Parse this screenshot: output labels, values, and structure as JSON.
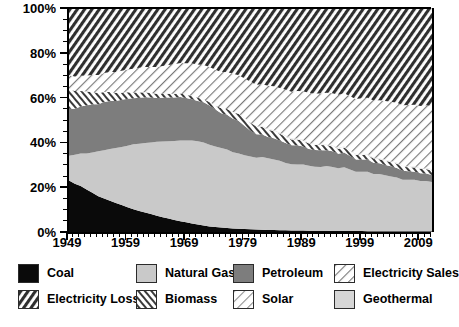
{
  "chart_data": {
    "type": "area",
    "title": "",
    "subtitle": "",
    "xlabel": "",
    "ylabel": "",
    "stacked": true,
    "normalized_percent": true,
    "grid": false,
    "legend_position": "bottom",
    "xlim": [
      1949,
      2011
    ],
    "ylim": [
      0,
      100
    ],
    "yticks": [
      0,
      20,
      40,
      60,
      80,
      100
    ],
    "ytick_labels": [
      "0%",
      "20%",
      "40%",
      "60%",
      "80%",
      "100%"
    ],
    "xticks": [
      1949,
      1959,
      1969,
      1979,
      1989,
      1999,
      2009
    ],
    "xtick_labels": [
      "1949",
      "1959",
      "1969",
      "1979",
      "1989",
      "1999",
      "2009"
    ],
    "x_minor_tick_interval": 1,
    "y_minor_tick_interval": 5,
    "x": [
      1949,
      1950,
      1951,
      1952,
      1953,
      1954,
      1955,
      1956,
      1957,
      1958,
      1959,
      1960,
      1961,
      1962,
      1963,
      1964,
      1965,
      1966,
      1967,
      1968,
      1969,
      1970,
      1971,
      1972,
      1973,
      1974,
      1975,
      1976,
      1977,
      1978,
      1979,
      1980,
      1981,
      1982,
      1983,
      1984,
      1985,
      1986,
      1987,
      1988,
      1989,
      1990,
      1991,
      1992,
      1993,
      1994,
      1995,
      1996,
      1997,
      1998,
      1999,
      2000,
      2001,
      2002,
      2003,
      2004,
      2005,
      2006,
      2007,
      2008,
      2009,
      2010,
      2011
    ],
    "series": [
      {
        "name": "Coal",
        "color": "#0a0a0a",
        "pattern": "solid",
        "values": [
          23.0,
          21.5,
          20.5,
          19.0,
          17.5,
          16.0,
          15.0,
          14.0,
          13.0,
          12.0,
          11.0,
          10.2,
          9.4,
          8.7,
          8.0,
          7.3,
          6.6,
          6.0,
          5.4,
          4.8,
          4.3,
          3.8,
          3.3,
          2.9,
          2.5,
          2.2,
          2.0,
          1.8,
          1.6,
          1.5,
          1.3,
          1.2,
          1.1,
          1.0,
          0.9,
          0.85,
          0.8,
          0.75,
          0.7,
          0.68,
          0.65,
          0.6,
          0.58,
          0.55,
          0.52,
          0.5,
          0.48,
          0.46,
          0.44,
          0.42,
          0.4,
          0.38,
          0.36,
          0.35,
          0.34,
          0.33,
          0.32,
          0.31,
          0.3,
          0.3,
          0.29,
          0.28,
          0.28
        ]
      },
      {
        "name": "Natural Gas",
        "color": "#c9c9c9",
        "pattern": "solid",
        "values": [
          11.0,
          13.0,
          14.5,
          16.0,
          18.0,
          20.0,
          21.5,
          23.0,
          24.5,
          26.0,
          27.5,
          29.0,
          30.0,
          31.0,
          32.0,
          33.0,
          33.8,
          34.5,
          35.2,
          36.0,
          36.5,
          37.0,
          37.2,
          37.0,
          36.5,
          36.0,
          35.5,
          35.0,
          34.0,
          33.5,
          33.0,
          32.5,
          32.0,
          32.5,
          32.0,
          31.5,
          31.0,
          30.0,
          29.5,
          29.5,
          29.5,
          29.0,
          28.5,
          28.5,
          29.0,
          28.5,
          28.0,
          28.5,
          27.5,
          26.5,
          26.5,
          26.5,
          25.5,
          25.5,
          25.0,
          24.5,
          24.0,
          23.0,
          23.0,
          23.0,
          22.5,
          22.5,
          22.0
        ]
      },
      {
        "name": "Petroleum",
        "color": "#7d7d7d",
        "pattern": "solid",
        "values": [
          21.0,
          20.5,
          21.0,
          21.5,
          21.5,
          21.0,
          21.5,
          21.5,
          21.0,
          21.0,
          21.0,
          20.5,
          20.5,
          20.5,
          20.0,
          19.5,
          19.5,
          19.5,
          19.5,
          19.5,
          19.0,
          18.5,
          18.0,
          18.0,
          17.5,
          16.5,
          15.5,
          15.5,
          15.0,
          14.5,
          13.0,
          11.5,
          10.5,
          10.0,
          9.5,
          9.5,
          9.0,
          9.0,
          8.5,
          8.5,
          8.0,
          7.5,
          7.5,
          7.5,
          7.0,
          7.0,
          6.5,
          6.5,
          6.0,
          5.5,
          5.5,
          5.5,
          5.0,
          4.8,
          4.6,
          4.5,
          4.3,
          4.0,
          3.8,
          3.6,
          3.4,
          3.3,
          3.2
        ]
      },
      {
        "name": "Biomass",
        "color": "#ffffff",
        "pattern": "dense-diagonal",
        "values": [
          9.0,
          8.0,
          7.0,
          6.2,
          5.5,
          5.0,
          4.5,
          4.0,
          3.6,
          3.2,
          2.9,
          2.6,
          2.4,
          2.2,
          2.0,
          1.9,
          1.8,
          1.7,
          1.6,
          1.5,
          1.5,
          1.4,
          1.4,
          1.4,
          1.5,
          1.8,
          2.2,
          2.6,
          3.0,
          3.2,
          3.5,
          3.6,
          3.5,
          3.4,
          3.3,
          3.2,
          3.1,
          2.8,
          2.6,
          2.6,
          2.6,
          2.4,
          2.3,
          2.3,
          2.2,
          2.2,
          2.2,
          2.3,
          2.1,
          2.0,
          2.0,
          2.0,
          1.9,
          1.8,
          1.9,
          1.9,
          1.9,
          1.8,
          1.8,
          1.9,
          1.9,
          2.0,
          2.0
        ]
      },
      {
        "name": "Solar",
        "color": "#ffffff",
        "pattern": "light-diagonal",
        "values": [
          0,
          0,
          0,
          0,
          0,
          0,
          0,
          0,
          0,
          0,
          0,
          0,
          0,
          0,
          0,
          0,
          0,
          0,
          0,
          0,
          0,
          0,
          0,
          0,
          0,
          0,
          0,
          0,
          0,
          0.05,
          0.1,
          0.15,
          0.2,
          0.25,
          0.3,
          0.3,
          0.3,
          0.3,
          0.3,
          0.3,
          0.3,
          0.3,
          0.3,
          0.3,
          0.3,
          0.3,
          0.3,
          0.3,
          0.3,
          0.3,
          0.3,
          0.3,
          0.3,
          0.3,
          0.3,
          0.3,
          0.3,
          0.3,
          0.3,
          0.3,
          0.3,
          0.35,
          0.4
        ]
      },
      {
        "name": "Geothermal",
        "color": "#d6d6d6",
        "pattern": "solid",
        "values": [
          0,
          0,
          0,
          0,
          0,
          0,
          0,
          0,
          0,
          0,
          0,
          0,
          0,
          0,
          0,
          0,
          0,
          0,
          0,
          0,
          0,
          0,
          0,
          0,
          0,
          0,
          0,
          0,
          0,
          0.05,
          0.1,
          0.1,
          0.12,
          0.14,
          0.16,
          0.18,
          0.2,
          0.2,
          0.2,
          0.2,
          0.2,
          0.2,
          0.2,
          0.2,
          0.2,
          0.2,
          0.2,
          0.2,
          0.2,
          0.2,
          0.2,
          0.2,
          0.2,
          0.2,
          0.2,
          0.2,
          0.2,
          0.2,
          0.2,
          0.2,
          0.2,
          0.2,
          0.2
        ]
      },
      {
        "name": "Electricity Sales",
        "color": "#ffffff",
        "pattern": "light-diagonal",
        "values": [
          6.0,
          6.4,
          6.8,
          7.2,
          7.6,
          8.1,
          8.5,
          8.9,
          9.3,
          9.8,
          10.2,
          10.6,
          11.0,
          11.3,
          11.7,
          12.0,
          12.4,
          12.8,
          13.2,
          13.6,
          14.0,
          14.5,
          14.9,
          15.3,
          15.7,
          15.9,
          16.2,
          16.5,
          17.0,
          17.2,
          17.5,
          18.0,
          18.3,
          18.7,
          19.1,
          19.5,
          19.9,
          20.4,
          20.8,
          21.2,
          21.6,
          22.0,
          22.4,
          22.5,
          22.9,
          23.2,
          23.6,
          23.7,
          24.1,
          24.5,
          24.8,
          25.1,
          25.5,
          25.9,
          26.1,
          26.4,
          26.7,
          27.0,
          27.3,
          27.5,
          27.7,
          28.0,
          28.2
        ]
      },
      {
        "name": "Electricity Loss",
        "color": "#bdbdbd",
        "pattern": "dense-diagonal",
        "values": [
          30.0,
          30.6,
          30.2,
          30.1,
          29.9,
          29.9,
          29.0,
          28.6,
          28.6,
          27.9,
          27.4,
          27.1,
          26.7,
          26.3,
          26.3,
          26.3,
          25.9,
          25.5,
          25.1,
          24.6,
          24.7,
          24.8,
          25.2,
          25.4,
          26.3,
          27.6,
          28.6,
          28.6,
          29.4,
          30.1,
          31.55,
          32.95,
          34.28,
          34.11,
          34.94,
          35.17,
          35.7,
          36.55,
          37.4,
          37.02,
          37.15,
          38.0,
          38.22,
          38.15,
          38.18,
          38.3,
          38.72,
          38.04,
          39.46,
          40.58,
          40.3,
          40.01,
          41.24,
          41.25,
          41.6,
          42.08,
          42.28,
          43.44,
          43.32,
          43.2,
          43.66,
          43.12,
          43.6
        ]
      }
    ]
  },
  "axis": {
    "y_labels": [
      "100%",
      "80%",
      "60%",
      "40%",
      "20%",
      "0%"
    ],
    "x_labels": [
      "1949",
      "1959",
      "1969",
      "1979",
      "1989",
      "1999",
      "2009"
    ]
  },
  "legend": {
    "items": [
      {
        "label": "Coal",
        "swatch": "coal-swatch",
        "style": "solid-black"
      },
      {
        "label": "Natural Gas",
        "swatch": "natural-gas-swatch",
        "style": "solid-light-gray"
      },
      {
        "label": "Petroleum",
        "swatch": "petroleum-swatch",
        "style": "solid-mid-gray"
      },
      {
        "label": "Electricity Sales",
        "swatch": "electricity-sales-swatch",
        "style": "light-diagonal-hatch"
      },
      {
        "label": "Electricity Loss",
        "swatch": "electricity-loss-swatch",
        "style": "dense-diagonal-hatch"
      },
      {
        "label": "Biomass",
        "swatch": "biomass-swatch",
        "style": "dense-back-diagonal-hatch"
      },
      {
        "label": "Solar",
        "swatch": "solar-swatch",
        "style": "light-diagonal-hatch"
      },
      {
        "label": "Geothermal",
        "swatch": "geothermal-swatch",
        "style": "solid-pale-gray"
      }
    ]
  },
  "colors": {
    "coal": "#0a0a0a",
    "natural_gas": "#c9c9c9",
    "petroleum": "#7d7d7d",
    "geothermal": "#d6d6d6",
    "electricity_loss": "#bdbdbd",
    "axis": "#000000",
    "background": "#ffffff"
  }
}
